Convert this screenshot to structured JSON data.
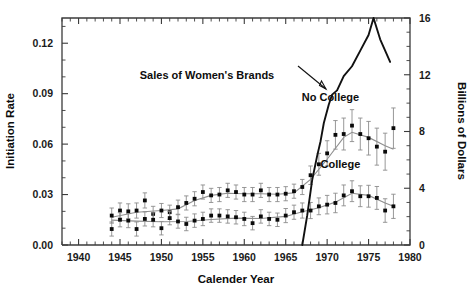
{
  "chart_data": {
    "type": "scatter",
    "title": "",
    "xlabel": "Calender Year",
    "ylabel": "Initiation Rate",
    "y2label": "Billions of Dollars",
    "xlim": [
      1938,
      1980
    ],
    "ylim": [
      0.0,
      0.135
    ],
    "y2lim": [
      0,
      16
    ],
    "grid": false,
    "legend_position": "inline-annotations",
    "xticks": [
      1940,
      1945,
      1950,
      1955,
      1960,
      1965,
      1970,
      1975,
      1980
    ],
    "xticklabels": [
      "1940",
      "1945",
      "1950",
      "1955",
      "1960",
      "1965",
      "1970",
      "1975",
      "1980"
    ],
    "yticks": [
      0.0,
      0.03,
      0.06,
      0.09,
      0.12
    ],
    "yticklabels": [
      "0.00",
      "0.03",
      "0.06",
      "0.09",
      "0.12"
    ],
    "y2ticks": [
      0,
      4,
      8,
      12,
      16
    ],
    "y2ticklabels": [
      "0",
      "4",
      "8",
      "12",
      "16"
    ],
    "annotations": [
      {
        "name": "sales-annotation",
        "text": "Sales of Women's Brands",
        "x": 1955.5,
        "y": 0.099
      },
      {
        "name": "no-college-annotation",
        "text": "No College",
        "x": 1970.4,
        "y": 0.0855
      },
      {
        "name": "college-annotation",
        "text": "College",
        "x": 1971.6,
        "y": 0.0455
      }
    ],
    "series": [
      {
        "name": "No College",
        "axis": "left",
        "marker": "filled-square",
        "x": [
          1944,
          1945,
          1946,
          1947,
          1948,
          1949,
          1950,
          1951,
          1952,
          1953,
          1954,
          1955,
          1956,
          1957,
          1958,
          1959,
          1960,
          1961,
          1962,
          1963,
          1964,
          1965,
          1966,
          1967,
          1968,
          1969,
          1970,
          1971,
          1972,
          1973,
          1974,
          1975,
          1976,
          1977,
          1978
        ],
        "values": [
          0.0175,
          0.0205,
          0.02,
          0.0205,
          0.0265,
          0.0185,
          0.0205,
          0.0195,
          0.0225,
          0.025,
          0.0275,
          0.0315,
          0.0295,
          0.03,
          0.0325,
          0.0315,
          0.03,
          0.03,
          0.0325,
          0.03,
          0.03,
          0.0305,
          0.032,
          0.0345,
          0.0415,
          0.048,
          0.0545,
          0.0655,
          0.066,
          0.071,
          0.066,
          0.0635,
          0.0585,
          0.0555,
          0.0695
        ],
        "errors": [
          0.0045,
          0.0045,
          0.0045,
          0.0045,
          0.0045,
          0.0045,
          0.0042,
          0.0042,
          0.0042,
          0.0042,
          0.0042,
          0.0042,
          0.0042,
          0.0042,
          0.0042,
          0.0042,
          0.0042,
          0.0042,
          0.0042,
          0.0042,
          0.0042,
          0.0042,
          0.0042,
          0.0045,
          0.0055,
          0.0065,
          0.0075,
          0.0085,
          0.0095,
          0.0095,
          0.0095,
          0.01,
          0.011,
          0.011,
          0.012
        ],
        "fit": {
          "x": [
            1944,
            1947,
            1950,
            1952,
            1954,
            1956,
            1958,
            1960,
            1962,
            1964,
            1966,
            1968,
            1970,
            1972,
            1973,
            1975,
            1977,
            1978
          ],
          "values": [
            0.0165,
            0.0195,
            0.0205,
            0.0215,
            0.0265,
            0.0295,
            0.0308,
            0.0305,
            0.0305,
            0.0302,
            0.031,
            0.039,
            0.051,
            0.064,
            0.067,
            0.064,
            0.059,
            0.057
          ]
        }
      },
      {
        "name": "College",
        "axis": "left",
        "marker": "filled-square",
        "x": [
          1944,
          1945,
          1946,
          1947,
          1948,
          1949,
          1950,
          1951,
          1952,
          1953,
          1954,
          1955,
          1956,
          1957,
          1958,
          1959,
          1960,
          1961,
          1962,
          1963,
          1964,
          1965,
          1966,
          1967,
          1968,
          1969,
          1970,
          1971,
          1972,
          1973,
          1974,
          1975,
          1976,
          1977,
          1978
        ],
        "values": [
          0.0095,
          0.015,
          0.0145,
          0.0095,
          0.0155,
          0.015,
          0.01,
          0.016,
          0.014,
          0.0125,
          0.0145,
          0.0155,
          0.0175,
          0.0175,
          0.017,
          0.0165,
          0.0155,
          0.013,
          0.017,
          0.0155,
          0.015,
          0.0175,
          0.0195,
          0.0205,
          0.0205,
          0.023,
          0.024,
          0.025,
          0.0295,
          0.032,
          0.029,
          0.029,
          0.028,
          0.0205,
          0.023
        ],
        "errors": [
          0.0042,
          0.0042,
          0.0042,
          0.0042,
          0.0042,
          0.0042,
          0.004,
          0.004,
          0.004,
          0.004,
          0.004,
          0.004,
          0.004,
          0.004,
          0.004,
          0.004,
          0.004,
          0.004,
          0.004,
          0.004,
          0.004,
          0.0042,
          0.0042,
          0.0045,
          0.0048,
          0.005,
          0.0055,
          0.0058,
          0.0062,
          0.0062,
          0.0062,
          0.0065,
          0.0068,
          0.007,
          0.0072
        ],
        "fit": {
          "x": [
            1944,
            1947,
            1950,
            1953,
            1956,
            1959,
            1962,
            1965,
            1967,
            1969,
            1971,
            1973,
            1975,
            1977,
            1978
          ],
          "values": [
            0.0148,
            0.0142,
            0.0138,
            0.014,
            0.0152,
            0.016,
            0.0158,
            0.017,
            0.0198,
            0.0222,
            0.0255,
            0.0308,
            0.0295,
            0.025,
            0.023
          ]
        }
      },
      {
        "name": "Sales of Women's Brands",
        "axis": "right",
        "marker": "none",
        "x": [
          1967.0,
          1967.6,
          1968.2,
          1968.8,
          1969.2,
          1969.6,
          1970.2,
          1970.6,
          1971.2,
          1972.0,
          1973.0,
          1974.0,
          1975.0,
          1975.6,
          1976.4,
          1977.6
        ],
        "values": [
          0.0,
          2.1,
          4.6,
          6.3,
          7.3,
          8.6,
          9.9,
          10.6,
          10.9,
          11.9,
          12.6,
          13.7,
          14.8,
          16.0,
          14.5,
          12.9
        ]
      }
    ]
  },
  "figure": {
    "background": "#ffffff",
    "axis_color": "#3b3b3b",
    "marker_color": "#0a0a0a",
    "error_color": "#8c8c8c",
    "fit_color": "#8f8f8f",
    "sales_color": "#111111"
  }
}
